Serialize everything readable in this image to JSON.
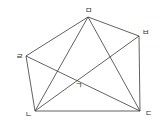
{
  "diagram": {
    "type": "geometric-figure",
    "stroke_color": "#3a3a3a",
    "label_color": "#333333",
    "vertices": [
      {
        "id": "m",
        "label": "ㅁ",
        "x": 88,
        "y": 17,
        "lx": 85,
        "ly": 13
      },
      {
        "id": "b",
        "label": "ㅂ",
        "x": 139,
        "y": 36,
        "lx": 142,
        "ly": 35
      },
      {
        "id": "r",
        "label": "ㄹ",
        "x": 26,
        "y": 56,
        "lx": 16,
        "ly": 59
      },
      {
        "id": "n",
        "label": "ㄴ",
        "x": 35,
        "y": 111,
        "lx": 25,
        "ly": 117
      },
      {
        "id": "d",
        "label": "ㄷ",
        "x": 140,
        "y": 111,
        "lx": 145,
        "ly": 116
      }
    ],
    "interior_point": {
      "id": "g",
      "label": "ㄱ",
      "lx": 75,
      "ly": 88
    },
    "edges": [
      [
        "r",
        "m"
      ],
      [
        "m",
        "b"
      ],
      [
        "r",
        "n"
      ],
      [
        "n",
        "d"
      ],
      [
        "b",
        "d"
      ],
      [
        "m",
        "n"
      ],
      [
        "m",
        "d"
      ],
      [
        "r",
        "d"
      ],
      [
        "n",
        "b"
      ]
    ]
  }
}
